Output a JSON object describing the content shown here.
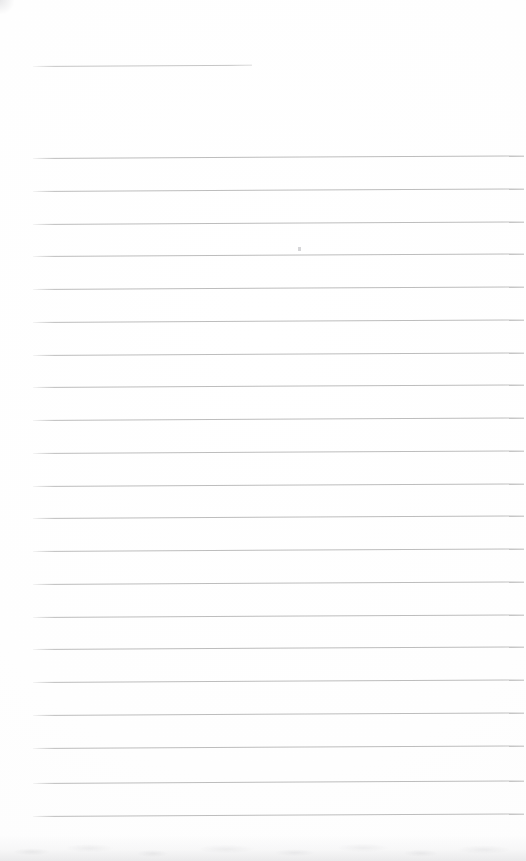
{
  "document": {
    "kind": "scanned-ruled-notebook-page",
    "title": "Blank ruled page",
    "page_width": 526,
    "page_height": 861,
    "background_color": "#fefefe",
    "body_text": ""
  },
  "ruling": {
    "line_color": "#bdbdbd",
    "header_line_color": "#c6c6c6",
    "line_thickness_px": 1,
    "line_spacing_px": 32.85,
    "left_margin_px": 33,
    "right_margin_px": 2,
    "rotation_deg": -0.3,
    "total_lines": 22,
    "body_line_count": 21,
    "header_line_count": 1
  },
  "header_rule": {
    "label": "title-rule",
    "x": 33,
    "y": 66,
    "width": 219
  },
  "body_rules": [
    {
      "label": "rule-1",
      "x": 33,
      "y": 158,
      "width": 491
    },
    {
      "label": "rule-2",
      "x": 33,
      "y": 191,
      "width": 491
    },
    {
      "label": "rule-3",
      "x": 33,
      "y": 224,
      "width": 491
    },
    {
      "label": "rule-4",
      "x": 33,
      "y": 256,
      "width": 491
    },
    {
      "label": "rule-5",
      "x": 33,
      "y": 289,
      "width": 491
    },
    {
      "label": "rule-6",
      "x": 33,
      "y": 322,
      "width": 491
    },
    {
      "label": "rule-7",
      "x": 33,
      "y": 355,
      "width": 491
    },
    {
      "label": "rule-8",
      "x": 33,
      "y": 387,
      "width": 491
    },
    {
      "label": "rule-9",
      "x": 33,
      "y": 420,
      "width": 491
    },
    {
      "label": "rule-10",
      "x": 33,
      "y": 453,
      "width": 491
    },
    {
      "label": "rule-11",
      "x": 33,
      "y": 486,
      "width": 491
    },
    {
      "label": "rule-12",
      "x": 33,
      "y": 518,
      "width": 491
    },
    {
      "label": "rule-13",
      "x": 33,
      "y": 551,
      "width": 491
    },
    {
      "label": "rule-14",
      "x": 33,
      "y": 584,
      "width": 491
    },
    {
      "label": "rule-15",
      "x": 33,
      "y": 617,
      "width": 491
    },
    {
      "label": "rule-16",
      "x": 33,
      "y": 649,
      "width": 491
    },
    {
      "label": "rule-17",
      "x": 33,
      "y": 682,
      "width": 491
    },
    {
      "label": "rule-18",
      "x": 33,
      "y": 715,
      "width": 491
    },
    {
      "label": "rule-19",
      "x": 33,
      "y": 748,
      "width": 491
    },
    {
      "label": "rule-20",
      "x": 33,
      "y": 783,
      "width": 491
    },
    {
      "label": "rule-21",
      "x": 33,
      "y": 816,
      "width": 491
    }
  ],
  "artifacts": {
    "dust_speck": {
      "label": "dust-speck",
      "x": 298,
      "y": 247,
      "color": "#d2d2d4"
    },
    "bottom_shadow": {
      "label": "bottom-scan-shadow",
      "height": 26
    },
    "corner_smudge": {
      "label": "corner-smudge",
      "x": 0,
      "y": 0
    }
  }
}
